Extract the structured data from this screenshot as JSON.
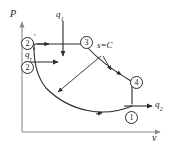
{
  "figure": {
    "type": "pressure-volume-thermodynamic-cycle",
    "axes": {
      "y_label": "P",
      "x_label": "v"
    },
    "heat_labels": {
      "q_in_top": {
        "base": "q",
        "sub": "1",
        "direction": "down"
      },
      "q_in_left": {
        "base": "q",
        "sub": "r",
        "direction": "right"
      },
      "q_out_right": {
        "base": "q",
        "sub": "2",
        "direction": "right"
      }
    },
    "process_label": {
      "text": "s=C"
    },
    "state_points": [
      {
        "id": "point-1",
        "label": "1",
        "prime": ""
      },
      {
        "id": "point-2",
        "label": "2",
        "prime": ""
      },
      {
        "id": "point-2-prime",
        "label": "2",
        "prime": "'"
      },
      {
        "id": "point-3",
        "label": "3",
        "prime": ""
      },
      {
        "id": "point-4",
        "label": "4",
        "prime": ""
      }
    ],
    "colors": {
      "line": "#2b2b2b",
      "axis": "#8a8a8a",
      "text": "#1a1a1a",
      "background": "#ffffff"
    }
  }
}
